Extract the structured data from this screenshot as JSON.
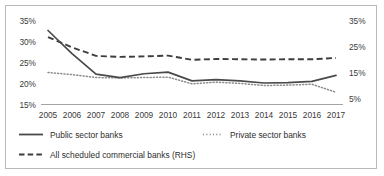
{
  "chart_data": {
    "type": "line",
    "title": "",
    "subtitle": "",
    "xlabel": "",
    "ylabel": "",
    "ylabel_right": "",
    "grid": false,
    "legend_position": "bottom",
    "categories": [
      "2005",
      "2006",
      "2007",
      "2008",
      "2009",
      "2010",
      "2011",
      "2012",
      "2013",
      "2014",
      "2015",
      "2016",
      "2017"
    ],
    "x_tick_labels": [
      "2005",
      "2006",
      "2007",
      "2008",
      "2009",
      "2010",
      "2011",
      "2012",
      "2013",
      "2014",
      "2015",
      "2016",
      "2017"
    ],
    "ylim": [
      15,
      35
    ],
    "y_tick_labels": [
      "35%",
      "30%",
      "25%",
      "20%",
      "15%"
    ],
    "y_tick_values": [
      35,
      30,
      25,
      20,
      15
    ],
    "ylim_right": [
      5,
      35
    ],
    "y_tick_labels_right": [
      "35%",
      "25%",
      "15%",
      "5%"
    ],
    "y_tick_values_right": [
      35,
      25,
      15,
      5
    ],
    "series": [
      {
        "name": "Public sector banks",
        "axis": "left",
        "style": "solid",
        "color": "#4a4a4a",
        "values": [
          32.5,
          27.0,
          22.1,
          21.3,
          22.2,
          22.6,
          20.5,
          20.8,
          20.5,
          20.0,
          20.1,
          20.4,
          21.8
        ]
      },
      {
        "name": "Private sector banks",
        "axis": "left",
        "style": "dotted",
        "color": "#8c8c8c",
        "values": [
          22.5,
          22.0,
          21.3,
          21.2,
          21.3,
          21.4,
          19.8,
          20.2,
          19.9,
          19.4,
          19.5,
          19.7,
          17.8
        ]
      },
      {
        "name": "All scheduled commercial banks (RHS)",
        "axis": "right",
        "style": "dashed",
        "color": "#3d3d3d",
        "values": [
          28.4,
          24.5,
          21.2,
          20.8,
          21.0,
          21.3,
          19.7,
          20.0,
          19.9,
          19.8,
          19.9,
          19.9,
          20.4
        ]
      }
    ],
    "legend": [
      {
        "label": "Public sector banks",
        "style": "solid"
      },
      {
        "label": "Private sector banks",
        "style": "dotted"
      },
      {
        "label": "All scheduled commercial banks (RHS)",
        "style": "dashed"
      }
    ]
  }
}
